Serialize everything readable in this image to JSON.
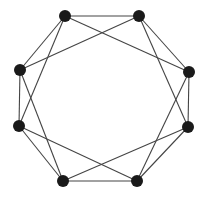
{
  "diagram": {
    "type": "graph",
    "colors": {
      "node": "#1a1a1a",
      "edge": "#444444",
      "background": "#ffffff"
    },
    "node_radius": 6,
    "nodes": [
      {
        "id": "A",
        "x": 65,
        "y": 16
      },
      {
        "id": "B",
        "x": 139,
        "y": 16
      },
      {
        "id": "C",
        "x": 189,
        "y": 72
      },
      {
        "id": "D",
        "x": 188,
        "y": 127
      },
      {
        "id": "E",
        "x": 137,
        "y": 181
      },
      {
        "id": "F",
        "x": 63,
        "y": 181
      },
      {
        "id": "G",
        "x": 19,
        "y": 126
      },
      {
        "id": "H",
        "x": 20,
        "y": 70
      }
    ],
    "edges": [
      [
        "A",
        "B"
      ],
      [
        "B",
        "C"
      ],
      [
        "C",
        "D"
      ],
      [
        "D",
        "E"
      ],
      [
        "E",
        "F"
      ],
      [
        "F",
        "G"
      ],
      [
        "G",
        "H"
      ],
      [
        "H",
        "A"
      ],
      [
        "A",
        "C"
      ],
      [
        "B",
        "D"
      ],
      [
        "C",
        "E"
      ],
      [
        "D",
        "F"
      ],
      [
        "E",
        "G"
      ],
      [
        "F",
        "H"
      ],
      [
        "G",
        "A"
      ],
      [
        "H",
        "B"
      ]
    ]
  }
}
